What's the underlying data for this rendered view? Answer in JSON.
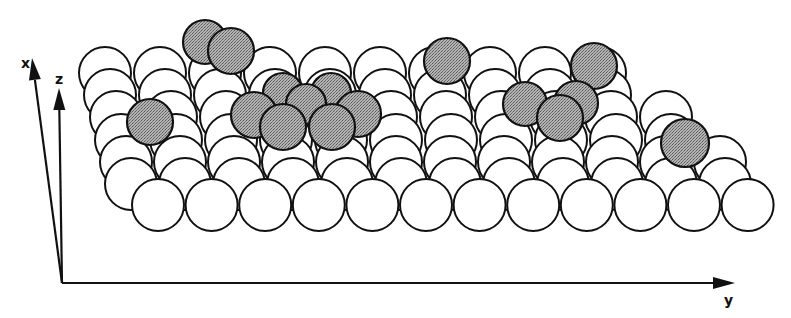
{
  "figure": {
    "colors": {
      "background": "#ffffff",
      "stroke": "#111111",
      "substrate_fill": "#ffffff",
      "adsorbate_fill": "#9a9a9a"
    },
    "axes": {
      "origin": [
        62,
        283
      ],
      "x": {
        "label": "x",
        "tip": [
          32,
          58
        ],
        "label_pos": [
          21,
          68
        ]
      },
      "z": {
        "label": "z",
        "tip": [
          59,
          88
        ],
        "label_pos": [
          55,
          84
        ]
      },
      "y": {
        "label": "y",
        "tip": [
          735,
          283
        ],
        "label_pos": [
          724,
          305
        ]
      }
    },
    "substrate": {
      "radius": 26,
      "rows": [
        {
          "y": 73,
          "x_start": 105,
          "count": 10,
          "spacing": 55
        },
        {
          "y": 95,
          "x_start": 110,
          "count": 10,
          "spacing": 55
        },
        {
          "y": 117,
          "x_start": 116,
          "count": 11,
          "spacing": 55
        },
        {
          "y": 140,
          "x_start": 121,
          "count": 11,
          "spacing": 55
        },
        {
          "y": 162,
          "x_start": 126,
          "count": 12,
          "spacing": 54
        },
        {
          "y": 184,
          "x_start": 131,
          "count": 12,
          "spacing": 54
        },
        {
          "y": 205,
          "x_start": 158,
          "count": 12,
          "spacing": 53.6
        }
      ]
    },
    "adsorbates": [
      {
        "x": 205,
        "y": 42,
        "r": 22
      },
      {
        "x": 231,
        "y": 51,
        "r": 23
      },
      {
        "x": 447,
        "y": 61,
        "r": 23
      },
      {
        "x": 594,
        "y": 66,
        "r": 23
      },
      {
        "x": 150,
        "y": 122,
        "r": 23
      },
      {
        "x": 283,
        "y": 93,
        "r": 20
      },
      {
        "x": 331,
        "y": 93,
        "r": 20
      },
      {
        "x": 306,
        "y": 104,
        "r": 20
      },
      {
        "x": 254,
        "y": 115,
        "r": 23
      },
      {
        "x": 358,
        "y": 114,
        "r": 23
      },
      {
        "x": 283,
        "y": 127,
        "r": 23
      },
      {
        "x": 332,
        "y": 127,
        "r": 23
      },
      {
        "x": 576,
        "y": 103,
        "r": 22
      },
      {
        "x": 525,
        "y": 104,
        "r": 22
      },
      {
        "x": 560,
        "y": 118,
        "r": 23
      },
      {
        "x": 685,
        "y": 143,
        "r": 24
      }
    ]
  }
}
